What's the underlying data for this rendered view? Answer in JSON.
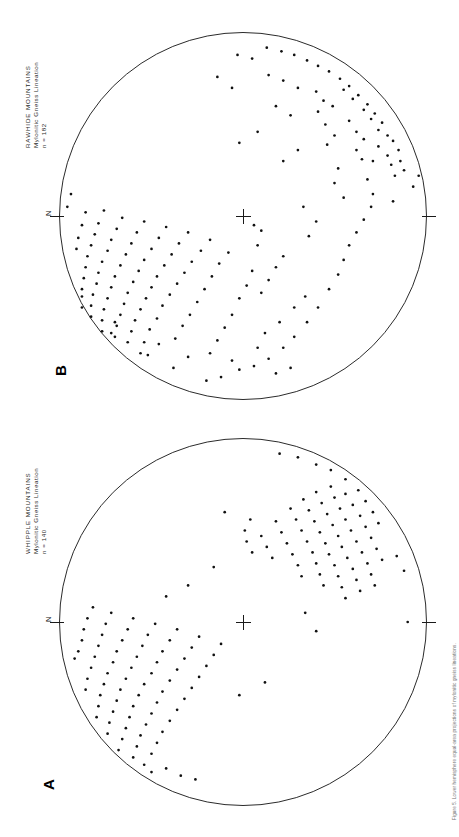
{
  "figure": {
    "type": "stereonet-pair",
    "background": "#ffffff",
    "ink": "#111111",
    "caption": "Figure 5. Lower hemisphere equal-area projections of mylonitic gneiss lineations."
  },
  "panels": [
    {
      "id": "B",
      "letter": "B",
      "title_line1": "RAWHIDE  MOUNTAINS",
      "title_line2": "Mylonitic  Gneiss  Lineation",
      "title_line3": "n = 182",
      "n": 182,
      "north_label": "N",
      "center_marker": "cross",
      "circle": {
        "cx": 243,
        "cy": 216,
        "r": 184
      }
    },
    {
      "id": "A",
      "letter": "A",
      "title_line1": "WHIPPLE  MOUNTAINS",
      "title_line2": "Mylonitic  Gneiss  Lineation",
      "title_line3": "n = 140",
      "n": 140,
      "north_label": "N",
      "center_marker": "cross",
      "circle": {
        "cx": 243,
        "cy": 622,
        "r": 184
      }
    }
  ],
  "chart_data": [
    {
      "type": "scatter",
      "title": "RAWHIDE MOUNTAINS — Mylonitic Gneiss Lineation",
      "subtitle": "n = 182",
      "projection": "equal-area lower hemisphere stereonet",
      "xlabel": "",
      "ylabel": "",
      "grid": false,
      "legend": null,
      "annotations": [
        "N at left of primitive circle",
        "center cross at origin"
      ],
      "xlim": [
        -1,
        1
      ],
      "ylim": [
        -1,
        1
      ],
      "points": [
        [
          -0.16,
          0.93
        ],
        [
          -0.36,
          0.85
        ],
        [
          -0.3,
          0.86
        ],
        [
          -0.25,
          0.88
        ],
        [
          -0.41,
          0.82
        ],
        [
          -0.44,
          0.79
        ],
        [
          -0.51,
          0.76
        ],
        [
          -0.56,
          0.72
        ],
        [
          -0.61,
          0.68
        ],
        [
          -0.66,
          0.63
        ],
        [
          -0.71,
          0.58
        ],
        [
          -0.75,
          0.53
        ],
        [
          -0.79,
          0.47
        ],
        [
          -0.82,
          0.41
        ],
        [
          -0.85,
          0.35
        ],
        [
          -0.88,
          0.28
        ],
        [
          -0.9,
          0.21
        ],
        [
          -0.92,
          0.13
        ],
        [
          -0.64,
          0.6
        ],
        [
          -0.69,
          0.55
        ],
        [
          -0.58,
          0.66
        ],
        [
          -0.53,
          0.7
        ],
        [
          -0.47,
          0.74
        ],
        [
          -0.33,
          0.79
        ],
        [
          -0.28,
          0.81
        ],
        [
          -0.22,
          0.83
        ],
        [
          -0.38,
          0.74
        ],
        [
          -0.3,
          0.71
        ],
        [
          -0.42,
          0.66
        ],
        [
          -0.46,
          0.62
        ],
        [
          -0.36,
          0.62
        ],
        [
          -0.31,
          0.65
        ],
        [
          -0.6,
          0.49
        ],
        [
          -0.63,
          0.44
        ],
        [
          -0.57,
          0.41
        ],
        [
          -0.2,
          0.68
        ],
        [
          -0.12,
          0.71
        ],
        [
          -0.05,
          0.7
        ],
        [
          0.02,
          0.66
        ],
        [
          0.09,
          0.62
        ],
        [
          -0.44,
          0.5
        ],
        [
          -0.39,
          0.46
        ],
        [
          -0.5,
          0.45
        ],
        [
          -0.26,
          0.52
        ],
        [
          -0.18,
          0.5
        ],
        [
          -0.1,
          0.55
        ],
        [
          0.16,
          0.58
        ],
        [
          0.24,
          0.55
        ],
        [
          0.32,
          0.52
        ],
        [
          0.4,
          0.47
        ],
        [
          0.5,
          0.41
        ],
        [
          0.58,
          0.35
        ],
        [
          0.66,
          0.28
        ],
        [
          0.72,
          0.22
        ],
        [
          -0.7,
          0.3
        ],
        [
          -0.74,
          0.22
        ],
        [
          -0.77,
          0.14
        ],
        [
          -0.86,
          0.05
        ],
        [
          -0.88,
          -0.03
        ],
        [
          0.03,
          0.4
        ],
        [
          0.11,
          0.36
        ],
        [
          -0.05,
          0.33
        ],
        [
          -0.55,
          0.26
        ],
        [
          -0.6,
          0.18
        ],
        [
          0.78,
          0.14
        ],
        [
          0.82,
          0.06
        ],
        [
          0.84,
          -0.02
        ],
        [
          -0.36,
          0.3
        ],
        [
          -0.3,
          0.22
        ],
        [
          -0.7,
          -0.06
        ],
        [
          -0.76,
          -0.14
        ],
        [
          0.05,
          0.06
        ],
        [
          0.08,
          0.1
        ],
        [
          0.3,
          0.05
        ],
        [
          0.38,
          0.02
        ],
        [
          0.45,
          -0.02
        ],
        [
          0.54,
          -0.06
        ],
        [
          0.61,
          -0.1
        ],
        [
          0.68,
          -0.14
        ],
        [
          0.75,
          -0.18
        ],
        [
          0.2,
          -0.08
        ],
        [
          0.26,
          -0.13
        ],
        [
          0.33,
          -0.17
        ],
        [
          0.4,
          -0.21
        ],
        [
          0.47,
          -0.25
        ],
        [
          0.54,
          -0.29
        ],
        [
          0.6,
          -0.33
        ],
        [
          0.67,
          -0.37
        ],
        [
          0.13,
          -0.18
        ],
        [
          0.19,
          -0.23
        ],
        [
          0.25,
          -0.28
        ],
        [
          0.31,
          -0.32
        ],
        [
          0.37,
          -0.36
        ],
        [
          0.43,
          -0.4
        ],
        [
          0.49,
          -0.44
        ],
        [
          0.56,
          -0.47
        ],
        [
          0.62,
          -0.51
        ],
        [
          0.69,
          -0.54
        ],
        [
          0.75,
          -0.56
        ],
        [
          0.09,
          -0.3
        ],
        [
          0.15,
          -0.35
        ],
        [
          0.21,
          -0.39
        ],
        [
          0.27,
          -0.43
        ],
        [
          0.33,
          -0.47
        ],
        [
          0.39,
          -0.5
        ],
        [
          0.45,
          -0.53
        ],
        [
          0.51,
          -0.56
        ],
        [
          0.57,
          -0.59
        ],
        [
          0.63,
          -0.61
        ],
        [
          0.69,
          -0.63
        ],
        [
          0.06,
          -0.42
        ],
        [
          0.12,
          -0.46
        ],
        [
          0.18,
          -0.5
        ],
        [
          0.24,
          -0.54
        ],
        [
          0.3,
          -0.57
        ],
        [
          0.36,
          -0.6
        ],
        [
          0.42,
          -0.63
        ],
        [
          0.48,
          -0.65
        ],
        [
          0.54,
          -0.67
        ],
        [
          0.6,
          -0.69
        ],
        [
          0.66,
          -0.7
        ],
        [
          0.03,
          -0.54
        ],
        [
          0.09,
          -0.58
        ],
        [
          0.15,
          -0.61
        ],
        [
          0.21,
          -0.64
        ],
        [
          0.27,
          -0.67
        ],
        [
          0.33,
          -0.7
        ],
        [
          0.39,
          -0.72
        ],
        [
          0.45,
          -0.74
        ],
        [
          0.51,
          -0.76
        ],
        [
          0.57,
          -0.77
        ],
        [
          0.63,
          -0.77
        ],
        [
          0.01,
          -0.66
        ],
        [
          0.07,
          -0.69
        ],
        [
          0.13,
          -0.72
        ],
        [
          0.19,
          -0.74
        ],
        [
          0.25,
          -0.77
        ],
        [
          0.31,
          -0.79
        ],
        [
          0.37,
          -0.8
        ],
        [
          0.43,
          -0.82
        ],
        [
          0.49,
          -0.83
        ],
        [
          0.55,
          -0.83
        ],
        [
          -0.03,
          -0.76
        ],
        [
          0.04,
          -0.79
        ],
        [
          0.1,
          -0.81
        ],
        [
          0.16,
          -0.83
        ],
        [
          0.22,
          -0.85
        ],
        [
          0.28,
          -0.86
        ],
        [
          0.34,
          -0.87
        ],
        [
          0.4,
          -0.88
        ],
        [
          -0.02,
          -0.86
        ],
        [
          0.05,
          -0.88
        ],
        [
          0.12,
          -0.9
        ],
        [
          0.18,
          -0.91
        ],
        [
          -0.46,
          0.08
        ],
        [
          -0.4,
          -0.02
        ],
        [
          0.83,
          0.26
        ],
        [
          0.86,
          0.18
        ],
        [
          0.72,
          0.08
        ],
        [
          0.79,
          -0.06
        ],
        [
          0.88,
          -0.12
        ],
        [
          0.9,
          -0.2
        ],
        [
          0.77,
          -0.3
        ],
        [
          0.83,
          -0.38
        ],
        [
          0.7,
          -0.46
        ],
        [
          0.76,
          -0.52
        ],
        [
          0.58,
          -0.7
        ],
        [
          0.64,
          -0.72
        ],
        [
          0.44,
          -0.88
        ],
        [
          0.5,
          -0.88
        ],
        [
          -0.12,
          -0.94
        ],
        [
          -0.05,
          -0.96
        ],
        [
          0.22,
          0.22
        ],
        [
          0.28,
          0.18
        ],
        [
          0.35,
          0.14
        ],
        [
          0.16,
          0.08
        ],
        [
          0.42,
          0.1
        ],
        [
          -0.68,
          0.4
        ],
        [
          -0.52,
          0.58
        ],
        [
          -0.22,
          0.96
        ],
        [
          -0.08,
          0.82
        ],
        [
          0.58,
          0.2
        ],
        [
          0.64,
          0.12
        ],
        [
          0.5,
          0.28
        ],
        [
          0.44,
          0.34
        ]
      ]
    },
    {
      "type": "scatter",
      "title": "WHIPPLE MOUNTAINS — Mylonitic Gneiss Lineation",
      "subtitle": "n = 140",
      "projection": "equal-area lower hemisphere stereonet",
      "xlabel": "",
      "ylabel": "",
      "grid": false,
      "legend": null,
      "annotations": [
        "N at left of primitive circle",
        "center cross at origin"
      ],
      "xlim": [
        -1,
        1
      ],
      "ylim": [
        -1,
        1
      ],
      "points": [
        [
          -0.72,
          0.63
        ],
        [
          -0.66,
          0.67
        ],
        [
          -0.6,
          0.71
        ],
        [
          -0.54,
          0.74
        ],
        [
          -0.78,
          0.56
        ],
        [
          -0.83,
          0.48
        ],
        [
          -0.86,
          0.4
        ],
        [
          -0.7,
          0.56
        ],
        [
          -0.64,
          0.6
        ],
        [
          -0.58,
          0.64
        ],
        [
          -0.52,
          0.67
        ],
        [
          -0.46,
          0.7
        ],
        [
          -0.4,
          0.73
        ],
        [
          -0.34,
          0.76
        ],
        [
          -0.74,
          0.48
        ],
        [
          -0.68,
          0.5
        ],
        [
          -0.62,
          0.53
        ],
        [
          -0.56,
          0.56
        ],
        [
          -0.5,
          0.59
        ],
        [
          -0.44,
          0.62
        ],
        [
          -0.38,
          0.65
        ],
        [
          -0.32,
          0.68
        ],
        [
          -0.26,
          0.7
        ],
        [
          -0.2,
          0.72
        ],
        [
          -0.71,
          0.4
        ],
        [
          -0.65,
          0.43
        ],
        [
          -0.59,
          0.46
        ],
        [
          -0.53,
          0.49
        ],
        [
          -0.47,
          0.52
        ],
        [
          -0.41,
          0.54
        ],
        [
          -0.35,
          0.57
        ],
        [
          -0.29,
          0.6
        ],
        [
          -0.23,
          0.62
        ],
        [
          -0.17,
          0.64
        ],
        [
          -0.67,
          0.33
        ],
        [
          -0.61,
          0.36
        ],
        [
          -0.55,
          0.39
        ],
        [
          -0.49,
          0.42
        ],
        [
          -0.43,
          0.45
        ],
        [
          -0.37,
          0.47
        ],
        [
          -0.31,
          0.5
        ],
        [
          -0.25,
          0.52
        ],
        [
          -0.19,
          0.54
        ],
        [
          -0.13,
          0.56
        ],
        [
          -0.62,
          0.26
        ],
        [
          -0.56,
          0.29
        ],
        [
          -0.5,
          0.32
        ],
        [
          -0.44,
          0.35
        ],
        [
          -0.38,
          0.38
        ],
        [
          -0.32,
          0.4
        ],
        [
          -0.26,
          0.42
        ],
        [
          -0.2,
          0.44
        ],
        [
          -0.55,
          0.18
        ],
        [
          -0.49,
          0.21
        ],
        [
          -0.43,
          0.24
        ],
        [
          -0.37,
          0.27
        ],
        [
          -0.31,
          0.3
        ],
        [
          -0.25,
          0.32
        ],
        [
          -0.47,
          0.1
        ],
        [
          -0.41,
          0.13
        ],
        [
          -0.35,
          0.16
        ],
        [
          -0.56,
          0.04
        ],
        [
          -0.5,
          0.01
        ],
        [
          -0.9,
          0.3
        ],
        [
          -0.92,
          0.2
        ],
        [
          -0.44,
          0.02
        ],
        [
          -0.38,
          0.05
        ],
        [
          0.05,
          0.4
        ],
        [
          -0.05,
          0.34
        ],
        [
          0.12,
          -0.12
        ],
        [
          0.18,
          -0.16
        ],
        [
          0.24,
          -0.2
        ],
        [
          0.3,
          -0.24
        ],
        [
          0.36,
          -0.28
        ],
        [
          0.42,
          -0.32
        ],
        [
          0.48,
          -0.36
        ],
        [
          0.54,
          -0.4
        ],
        [
          0.6,
          -0.44
        ],
        [
          0.66,
          -0.47
        ],
        [
          0.72,
          -0.5
        ],
        [
          0.08,
          -0.24
        ],
        [
          0.14,
          -0.28
        ],
        [
          0.2,
          -0.32
        ],
        [
          0.26,
          -0.36
        ],
        [
          0.32,
          -0.4
        ],
        [
          0.38,
          -0.44
        ],
        [
          0.44,
          -0.47
        ],
        [
          0.5,
          -0.5
        ],
        [
          0.56,
          -0.53
        ],
        [
          0.62,
          -0.56
        ],
        [
          0.68,
          -0.58
        ],
        [
          0.74,
          -0.6
        ],
        [
          0.04,
          -0.36
        ],
        [
          0.1,
          -0.4
        ],
        [
          0.16,
          -0.44
        ],
        [
          0.22,
          -0.47
        ],
        [
          0.28,
          -0.5
        ],
        [
          0.34,
          -0.54
        ],
        [
          0.4,
          -0.57
        ],
        [
          0.46,
          -0.6
        ],
        [
          0.52,
          -0.62
        ],
        [
          0.58,
          -0.64
        ],
        [
          0.64,
          -0.66
        ],
        [
          0.7,
          -0.68
        ],
        [
          0.01,
          -0.48
        ],
        [
          0.07,
          -0.52
        ],
        [
          0.13,
          -0.55
        ],
        [
          0.19,
          -0.58
        ],
        [
          0.25,
          -0.61
        ],
        [
          0.31,
          -0.64
        ],
        [
          0.37,
          -0.67
        ],
        [
          0.43,
          -0.69
        ],
        [
          0.49,
          -0.71
        ],
        [
          0.55,
          -0.73
        ],
        [
          0.61,
          -0.74
        ],
        [
          -0.02,
          -0.6
        ],
        [
          0.04,
          -0.63
        ],
        [
          0.1,
          -0.66
        ],
        [
          0.16,
          -0.69
        ],
        [
          0.22,
          -0.71
        ],
        [
          0.28,
          -0.74
        ],
        [
          0.34,
          -0.76
        ],
        [
          0.4,
          -0.78
        ],
        [
          0.46,
          -0.79
        ],
        [
          0.52,
          -0.8
        ],
        [
          -0.05,
          -0.72
        ],
        [
          0.01,
          -0.75
        ],
        [
          0.07,
          -0.77
        ],
        [
          0.13,
          -0.79
        ],
        [
          0.19,
          -0.81
        ],
        [
          0.25,
          -0.83
        ],
        [
          0.31,
          -0.85
        ],
        [
          0.37,
          -0.86
        ],
        [
          -0.08,
          -0.82
        ],
        [
          -0.02,
          -0.85
        ],
        [
          0.04,
          -0.87
        ],
        [
          0.1,
          -0.88
        ],
        [
          0.16,
          -0.9
        ],
        [
          0.8,
          -0.42
        ],
        [
          0.84,
          -0.34
        ],
        [
          0.86,
          -0.26
        ],
        [
          0.78,
          -0.54
        ],
        [
          0.82,
          -0.5
        ],
        [
          0.33,
          0.12
        ],
        [
          0.4,
          -0.02
        ],
        [
          -0.28,
          0.88
        ],
        [
          -0.36,
          0.84
        ],
        [
          -0.2,
          -0.3
        ],
        [
          -0.14,
          -0.42
        ],
        [
          0.0,
          0.9
        ],
        [
          0.2,
          -0.92
        ],
        [
          -0.6,
          -0.1
        ],
        [
          -0.3,
          -0.16
        ]
      ]
    }
  ]
}
